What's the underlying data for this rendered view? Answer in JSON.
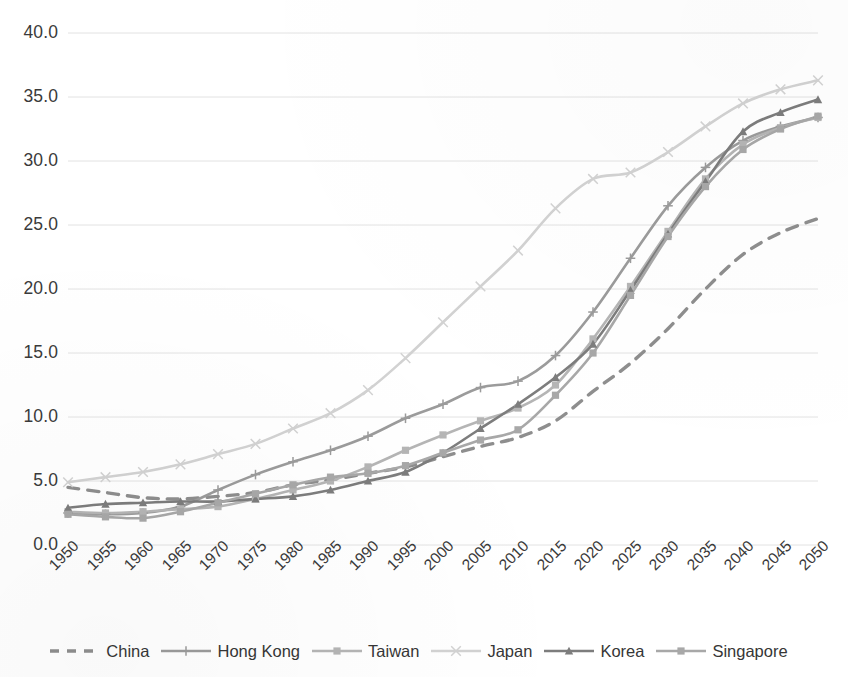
{
  "chart_data": {
    "type": "line",
    "title": "",
    "subtitle": "",
    "xlabel": "",
    "ylabel": "",
    "xlim": [
      1950,
      2050
    ],
    "ylim": [
      0.0,
      40.0
    ],
    "y_ticks": [
      "0.0",
      "5.0",
      "10.0",
      "15.0",
      "20.0",
      "25.0",
      "30.0",
      "35.0",
      "40.0"
    ],
    "y_tick_values": [
      0,
      5,
      10,
      15,
      20,
      25,
      30,
      35,
      40
    ],
    "grid": true,
    "grid_axis": "y",
    "legend_position": "bottom",
    "x": [
      1950,
      1955,
      1960,
      1965,
      1970,
      1975,
      1980,
      1985,
      1990,
      1995,
      2000,
      2005,
      2010,
      2015,
      2020,
      2025,
      2030,
      2035,
      2040,
      2045,
      2050
    ],
    "categories": [
      "1950",
      "1955",
      "1960",
      "1965",
      "1970",
      "1975",
      "1980",
      "1985",
      "1990",
      "1995",
      "2000",
      "2005",
      "2010",
      "2015",
      "2020",
      "2025",
      "2030",
      "2035",
      "2040",
      "2045",
      "2050"
    ],
    "series": [
      {
        "name": "China",
        "color": "#8e8e8e",
        "style": "dashed",
        "marker": "none",
        "values": [
          4.5,
          4.1,
          3.7,
          3.6,
          3.8,
          4.1,
          4.7,
          5.1,
          5.6,
          6.1,
          6.9,
          7.7,
          8.4,
          9.7,
          12.0,
          14.2,
          16.9,
          20.0,
          22.7,
          24.4,
          25.5
        ]
      },
      {
        "name": "Hong Kong",
        "color": "#9b9b9b",
        "style": "solid",
        "marker": "plus",
        "values": [
          2.5,
          2.4,
          2.5,
          3.0,
          4.3,
          5.5,
          6.5,
          7.4,
          8.5,
          9.9,
          11.0,
          12.3,
          12.8,
          14.8,
          18.2,
          22.4,
          26.5,
          29.5,
          31.6,
          32.7,
          33.4
        ]
      },
      {
        "name": "Taiwan",
        "color": "#b5b5b5",
        "style": "solid",
        "marker": "square",
        "values": [
          2.6,
          2.5,
          2.6,
          2.8,
          3.0,
          3.6,
          4.3,
          5.0,
          6.1,
          7.4,
          8.6,
          9.7,
          10.7,
          12.5,
          16.1,
          20.2,
          24.5,
          28.6,
          31.3,
          32.6,
          33.4
        ]
      },
      {
        "name": "Japan",
        "color": "#d2d2d2",
        "style": "solid",
        "marker": "cross",
        "values": [
          4.9,
          5.3,
          5.7,
          6.3,
          7.1,
          7.9,
          9.1,
          10.3,
          12.1,
          14.6,
          17.4,
          20.2,
          23.0,
          26.3,
          28.6,
          29.1,
          30.7,
          32.7,
          34.5,
          35.6,
          36.3
        ]
      },
      {
        "name": "Korea",
        "color": "#7d7d7d",
        "style": "solid",
        "marker": "triangle",
        "values": [
          2.9,
          3.2,
          3.3,
          3.4,
          3.4,
          3.6,
          3.8,
          4.3,
          5.0,
          5.7,
          7.2,
          9.1,
          11.0,
          13.1,
          15.7,
          19.9,
          24.3,
          28.4,
          32.3,
          33.8,
          34.8
        ]
      },
      {
        "name": "Singapore",
        "color": "#a8a8a8",
        "style": "solid",
        "marker": "square",
        "values": [
          2.4,
          2.2,
          2.1,
          2.6,
          3.3,
          4.0,
          4.7,
          5.3,
          5.6,
          6.2,
          7.2,
          8.2,
          9.0,
          11.7,
          15.0,
          19.5,
          24.1,
          28.0,
          30.9,
          32.5,
          33.5
        ]
      }
    ]
  },
  "legend": {
    "items": [
      {
        "label": "China",
        "swatch": "china-swatch"
      },
      {
        "label": "Hong Kong",
        "swatch": "hong-kong-swatch"
      },
      {
        "label": "Taiwan",
        "swatch": "taiwan-swatch"
      },
      {
        "label": "Japan",
        "swatch": "japan-swatch"
      },
      {
        "label": "Korea",
        "swatch": "korea-swatch"
      },
      {
        "label": "Singapore",
        "swatch": "singapore-swatch"
      }
    ]
  },
  "colors": {
    "axis_text": "#3a3a3a",
    "gridline": "#e2e2e2",
    "background": "#ffffff"
  }
}
